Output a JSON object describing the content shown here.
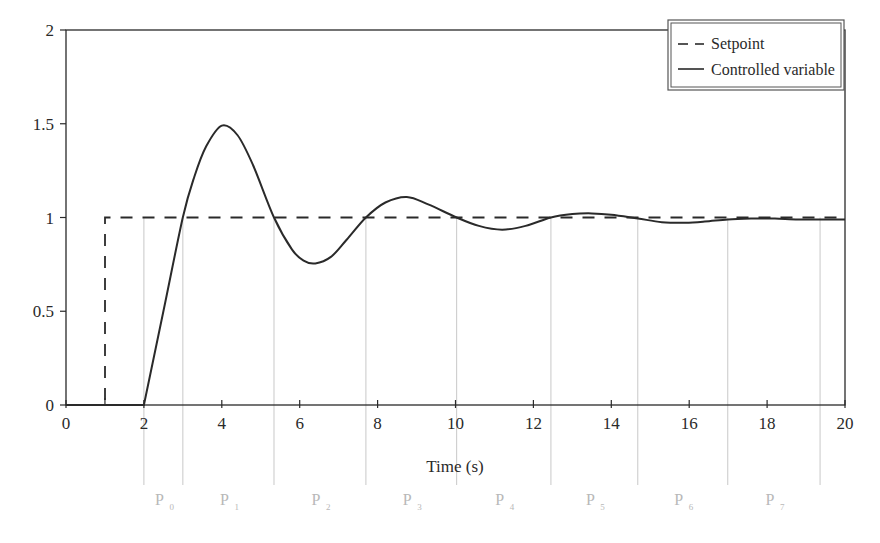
{
  "chart_data": {
    "type": "line",
    "title": "",
    "xlabel": "Time (s)",
    "ylabel": "",
    "xlim": [
      0,
      20
    ],
    "ylim": [
      0,
      2
    ],
    "x_ticks": [
      0,
      2,
      4,
      6,
      8,
      10,
      12,
      14,
      16,
      18,
      20
    ],
    "x_tick_labels": [
      "0",
      "2",
      "4",
      "6",
      "8",
      "10",
      "12",
      "14",
      "16",
      "18",
      "20"
    ],
    "y_ticks": [
      0,
      0.5,
      1,
      1.5,
      2
    ],
    "y_tick_labels": [
      "0",
      "0.5",
      "1",
      "1.5",
      "2"
    ],
    "grid": false,
    "legend_position": "upper right",
    "legend": [
      "Setpoint",
      "Controlled variable"
    ],
    "series": [
      {
        "name": "Setpoint",
        "style": "dashed",
        "color": "#2a2a2a",
        "x": [
          0,
          1,
          1,
          20
        ],
        "y": [
          0,
          0,
          1,
          1
        ]
      },
      {
        "name": "Controlled variable",
        "style": "solid",
        "color": "#2a2a2a",
        "x": [
          0,
          2,
          2.5,
          3.0,
          3.3,
          3.6,
          4.0,
          4.4,
          4.8,
          5.34,
          5.8,
          6.1,
          6.4,
          6.8,
          7.2,
          7.7,
          8.2,
          8.75,
          9.3,
          10.03,
          10.6,
          11.2,
          11.8,
          12.45,
          13.0,
          13.5,
          14.0,
          14.68,
          15.3,
          15.9,
          16.4,
          16.99,
          17.6,
          18.2,
          18.8,
          19.36,
          20
        ],
        "y": [
          0,
          0,
          0.5,
          1.0,
          1.22,
          1.38,
          1.49,
          1.44,
          1.28,
          1.0,
          0.83,
          0.77,
          0.755,
          0.79,
          0.88,
          1.0,
          1.08,
          1.11,
          1.07,
          1.0,
          0.955,
          0.935,
          0.955,
          1.0,
          1.018,
          1.022,
          1.015,
          0.995,
          0.975,
          0.972,
          0.978,
          0.99,
          0.995,
          0.994,
          0.99,
          0.99,
          0.99
        ]
      }
    ],
    "period_markers": {
      "x": [
        2,
        3.0,
        5.34,
        7.7,
        10.03,
        12.45,
        14.68,
        16.99,
        19.36
      ],
      "labels": [
        {
          "main": "P",
          "sub": "0"
        },
        {
          "main": "P",
          "sub": "1"
        },
        {
          "main": "P",
          "sub": "2"
        },
        {
          "main": "P",
          "sub": "3"
        },
        {
          "main": "P",
          "sub": "4"
        },
        {
          "main": "P",
          "sub": "5"
        },
        {
          "main": "P",
          "sub": "6"
        },
        {
          "main": "P",
          "sub": "7"
        }
      ],
      "color": "#c8c8c8"
    }
  },
  "legend": {
    "items": [
      {
        "label": "Setpoint"
      },
      {
        "label": "Controlled variable"
      }
    ]
  },
  "axes": {
    "xlabel": "Time (s)"
  },
  "colors": {
    "ink": "#2a2a2a",
    "marker_line": "#c8c8c8",
    "marker_text": "#b8b8b8"
  }
}
